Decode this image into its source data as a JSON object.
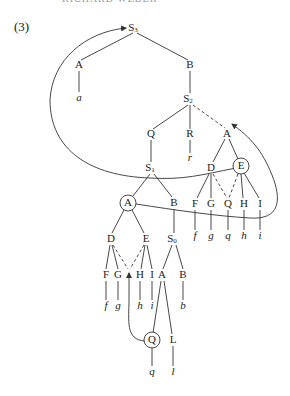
{
  "header": {
    "clipped_running_head": "RICHARD WEBER"
  },
  "example_number": "(3)",
  "tree": {
    "root": {
      "label": "S",
      "sub": "3"
    },
    "top_left": {
      "label": "A",
      "terminal": "a"
    },
    "top_right": {
      "label": "B"
    },
    "s2": {
      "label": "S",
      "sub": "2"
    },
    "s2_children": {
      "q": "Q",
      "r": "R",
      "r_terminal": "r",
      "a": "A"
    },
    "right_a_children": {
      "d": "D",
      "e": "E"
    },
    "right_row": {
      "labels": [
        "F",
        "G",
        "Q",
        "H",
        "I"
      ],
      "terminals": [
        "f",
        "g",
        "q",
        "h",
        "i"
      ]
    },
    "s1": {
      "label": "S",
      "sub": "1"
    },
    "s1_children": {
      "a": "A",
      "b": "B"
    },
    "left_a_children": {
      "d": "D",
      "e": "E"
    },
    "s0": {
      "label": "S",
      "sub": "0"
    },
    "left_row": {
      "labels": [
        "F",
        "G",
        "H",
        "I"
      ],
      "terminals": [
        "f",
        "g",
        "h",
        "i"
      ]
    },
    "s0_children": {
      "a": "A",
      "b": "B",
      "b_terminal": "b"
    },
    "bottom": {
      "q": "Q",
      "q_terminal": "q",
      "l": "L",
      "l_terminal": "l"
    }
  },
  "circled_nodes": [
    "E (right subtree)",
    "A (under S1)",
    "Q (bottom)"
  ],
  "arrows": [
    {
      "from": "E (circled, right)",
      "to": "S3",
      "style": "curved arrow"
    },
    {
      "from": "A (circled, left)",
      "to": "A (under S2, dashed link)",
      "style": "curved arrow"
    },
    {
      "from": "Q (circled, bottom)",
      "to": "D/E dashed junction",
      "style": "curved arrow"
    }
  ]
}
